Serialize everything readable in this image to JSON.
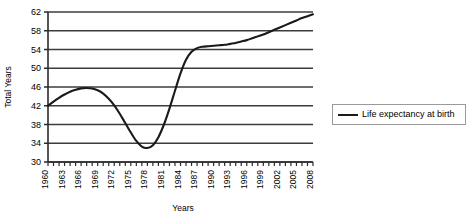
{
  "chart_data": {
    "type": "line",
    "title": "",
    "xlabel": "Years",
    "ylabel": "Total Years",
    "ylim": [
      30,
      62
    ],
    "xlim": [
      1960,
      2008
    ],
    "ytick_step": 4,
    "grid": true,
    "legend_position": "right",
    "line_color": "#1a1a1a",
    "grid_color": "#3c3c3c",
    "axis_color": "#2b2b2b",
    "y_ticks": [
      30,
      34,
      38,
      42,
      46,
      50,
      54,
      58,
      62
    ],
    "x_tick_labels": [
      "1960",
      "1963",
      "1966",
      "1969",
      "1972",
      "1975",
      "1978",
      "1981",
      "1984",
      "1987",
      "1990",
      "1993",
      "1996",
      "1999",
      "2002",
      "2005",
      "2008"
    ],
    "series": [
      {
        "name": "Life expectancy at birth",
        "x": [
          1960,
          1961,
          1962,
          1963,
          1964,
          1965,
          1966,
          1967,
          1968,
          1969,
          1970,
          1971,
          1972,
          1973,
          1974,
          1975,
          1976,
          1977,
          1978,
          1979,
          1980,
          1981,
          1982,
          1983,
          1984,
          1985,
          1986,
          1987,
          1988,
          1989,
          1990,
          1991,
          1992,
          1993,
          1994,
          1995,
          1996,
          1997,
          1998,
          1999,
          2000,
          2001,
          2002,
          2003,
          2004,
          2005,
          2006,
          2007,
          2008
        ],
        "values": [
          42.0,
          42.9,
          43.7,
          44.4,
          45.0,
          45.4,
          45.7,
          45.8,
          45.7,
          45.3,
          44.6,
          43.5,
          42.1,
          40.3,
          38.3,
          36.3,
          34.5,
          33.3,
          33.0,
          33.6,
          35.3,
          38.0,
          41.4,
          45.2,
          48.9,
          51.8,
          53.5,
          54.3,
          54.6,
          54.7,
          54.8,
          54.9,
          55.0,
          55.2,
          55.4,
          55.7,
          56.0,
          56.4,
          56.8,
          57.2,
          57.7,
          58.2,
          58.7,
          59.2,
          59.7,
          60.2,
          60.7,
          61.1,
          61.5
        ]
      }
    ]
  },
  "legend": {
    "entries": [
      {
        "label": "Life expectancy at birth",
        "color": "#1a1a1a"
      }
    ]
  },
  "axes": {
    "y_title": "Total Years",
    "x_title": "Years"
  }
}
